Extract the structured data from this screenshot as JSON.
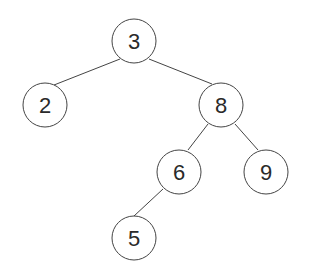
{
  "diagram": {
    "type": "binary-search-tree",
    "colors": {
      "stroke": "#444444",
      "text": "#2a2a2a",
      "fill": "#ffffff"
    },
    "nodes": [
      {
        "id": "n3",
        "label": "3",
        "x": 134,
        "y": 41
      },
      {
        "id": "n2",
        "label": "2",
        "x": 45,
        "y": 105
      },
      {
        "id": "n8",
        "label": "8",
        "x": 221,
        "y": 105
      },
      {
        "id": "n6",
        "label": "6",
        "x": 179,
        "y": 172
      },
      {
        "id": "n9",
        "label": "9",
        "x": 266,
        "y": 172
      },
      {
        "id": "n5",
        "label": "5",
        "x": 134,
        "y": 238
      }
    ],
    "edges": [
      {
        "from": "3",
        "to": "2"
      },
      {
        "from": "3",
        "to": "8"
      },
      {
        "from": "8",
        "to": "6"
      },
      {
        "from": "8",
        "to": "9"
      },
      {
        "from": "6",
        "to": "5"
      }
    ]
  }
}
